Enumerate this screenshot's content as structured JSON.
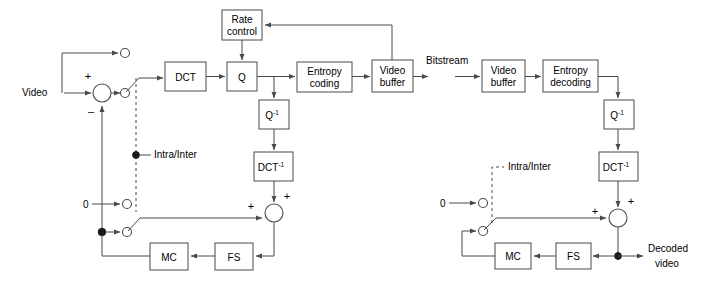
{
  "diagram": {
    "signal_labels": {
      "video_in": "Video",
      "bitstream": "Bitstream",
      "decoded_video_line1": "Decoded",
      "decoded_video_line2": "video",
      "intra_inter_encoder": "Intra/Inter",
      "intra_inter_decoder": "Intra/Inter",
      "zero_encoder": "0",
      "zero_decoder": "0"
    },
    "signs": {
      "sum_plus": "+",
      "sum_minus": "–",
      "adder_enc_left": "+",
      "adder_enc_top": "+",
      "adder_dec_left": "+",
      "adder_dec_top": "+"
    },
    "encoder_blocks": [
      {
        "id": "rate-control",
        "line1": "Rate",
        "line2": "control"
      },
      {
        "id": "dct",
        "line1": "DCT",
        "line2": ""
      },
      {
        "id": "q",
        "line1": "Q",
        "line2": ""
      },
      {
        "id": "entropy-coding",
        "line1": "Entropy",
        "line2": "coding"
      },
      {
        "id": "video-buffer-encoder",
        "line1": "Video",
        "line2": "buffer"
      },
      {
        "id": "inverse-q-encoder",
        "base": "Q",
        "exp": "-1"
      },
      {
        "id": "inverse-dct-encoder",
        "base": "DCT",
        "exp": "-1"
      },
      {
        "id": "mc-encoder",
        "line1": "MC",
        "line2": ""
      },
      {
        "id": "fs-encoder",
        "line1": "FS",
        "line2": ""
      }
    ],
    "decoder_blocks": [
      {
        "id": "video-buffer-decoder",
        "line1": "Video",
        "line2": "buffer"
      },
      {
        "id": "entropy-decoding",
        "line1": "Entropy",
        "line2": "decoding"
      },
      {
        "id": "inverse-q-decoder",
        "base": "Q",
        "exp": "-1"
      },
      {
        "id": "inverse-dct-decoder",
        "base": "DCT",
        "exp": "-1"
      },
      {
        "id": "mc-decoder",
        "line1": "MC",
        "line2": ""
      },
      {
        "id": "fs-decoder",
        "line1": "FS",
        "line2": ""
      }
    ],
    "colors": {
      "line": "#4a4a4a",
      "text": "#000000",
      "background": "#ffffff",
      "dot": "#1a1a1a"
    }
  }
}
